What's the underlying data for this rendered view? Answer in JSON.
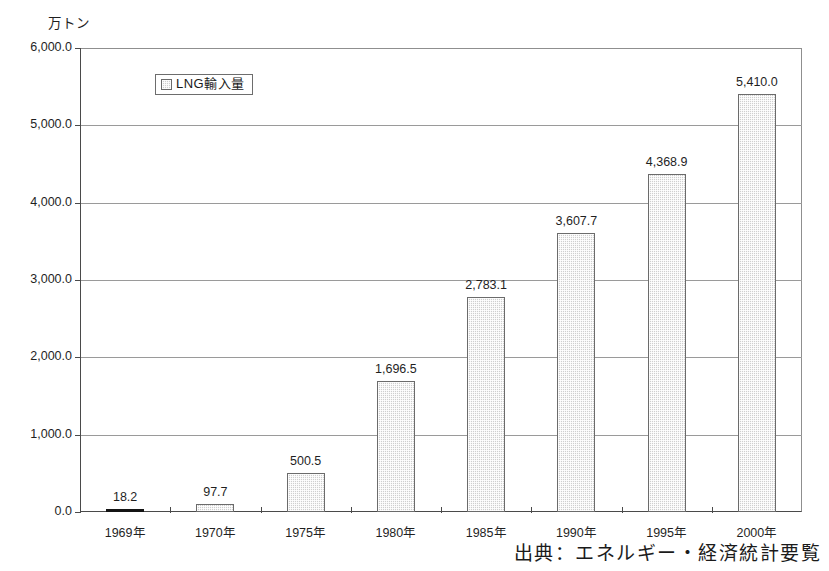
{
  "chart_data": {
    "type": "bar",
    "title": "",
    "unit_caption": "万トン",
    "xlabel": "",
    "ylabel": "",
    "ylim": [
      0,
      6000
    ],
    "ytick_step": 1000,
    "grid": true,
    "legend_position": "top-left-inside",
    "categories": [
      "1969年",
      "1970年",
      "1975年",
      "1980年",
      "1985年",
      "1990年",
      "1995年",
      "2000年"
    ],
    "values": [
      18.2,
      97.7,
      500.5,
      1696.5,
      2783.1,
      3607.7,
      4368.9,
      5410.0
    ],
    "value_labels": [
      "18.2",
      "97.7",
      "500.5",
      "1,696.5",
      "2,783.1",
      "3,607.7",
      "4,368.9",
      "5,410.0"
    ],
    "ytick_labels": [
      "0.0",
      "1,000.0",
      "2,000.0",
      "3,000.0",
      "4,000.0",
      "5,000.0",
      "6,000.0"
    ],
    "ytick_values": [
      0,
      1000,
      2000,
      3000,
      4000,
      5000,
      6000
    ],
    "series": [
      {
        "name": "LNG輸入量",
        "values": [
          18.2,
          97.7,
          500.5,
          1696.5,
          2783.1,
          3607.7,
          4368.9,
          5410.0
        ]
      }
    ],
    "annotations": [
      "出典：エネルギー・経済統計要覧"
    ]
  },
  "legend": {
    "label": "LNG輸入量"
  },
  "source": {
    "text": "出典：エネルギー・経済統計要覧"
  },
  "colors": {
    "bar_fill": "#cfcfcf",
    "bar_border": "#6b6b6b",
    "bar_solid": "#141414",
    "grid": "#9a9a9a",
    "axis": "#4a4a4a",
    "text": "#1f1f1f",
    "background": "#ffffff"
  }
}
